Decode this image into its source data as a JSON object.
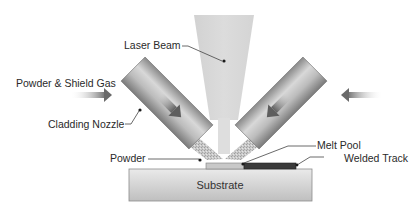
{
  "labels": {
    "laser_beam": "Laser Beam",
    "powder_shield_gas": "Powder & Shield Gas",
    "cladding_nozzle": "Cladding Nozzle",
    "powder": "Powder",
    "melt_pool": "Melt Pool",
    "welded_track": "Welded Track",
    "substrate": "Substrate"
  },
  "colors": {
    "beam": "#d6d6d6",
    "nozzle_light": "#d0d0d0",
    "nozzle_dark": "#7a7a7a",
    "powder_stream": "#c4c4c4",
    "melt_pool": "#c8c8c8",
    "welded_track": "#3a3a3a",
    "substrate_top": "#e6e6e6",
    "substrate_bottom": "#bdbdbd",
    "flow_arrow": "#6a6a6a"
  },
  "components": [
    {
      "name": "laser-beam",
      "shape": "tapered-cone",
      "direction": "down"
    },
    {
      "name": "left-cladding-nozzle",
      "angle_deg": 45,
      "flow": "down-right"
    },
    {
      "name": "right-cladding-nozzle",
      "angle_deg": -45,
      "flow": "down-left"
    },
    {
      "name": "left-inlet-arrow",
      "direction": "right"
    },
    {
      "name": "right-inlet-arrow",
      "direction": "left"
    },
    {
      "name": "substrate",
      "shape": "rectangle"
    },
    {
      "name": "melt-pool",
      "shape": "thin-layer"
    },
    {
      "name": "welded-track",
      "shape": "thin-layer"
    }
  ]
}
